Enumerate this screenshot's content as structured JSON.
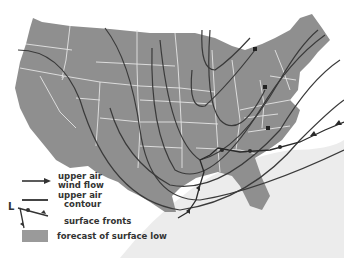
{
  "map": {
    "subject": "United States weather forecast map",
    "colors": {
      "land": "#8f8f8f",
      "state_borders": "#e4e4e4",
      "lines": "#3a3a3a",
      "surface_low": "#a5a5a5",
      "background": "#ffffff"
    }
  },
  "legend": {
    "items": [
      {
        "symbol": "arrow-line",
        "label_line1": "upper air",
        "label_line2": "wind flow"
      },
      {
        "symbol": "plain-line",
        "label_line1": "upper air",
        "label_line2": "contour"
      },
      {
        "symbol": "front-line",
        "label_line1": "surface fronts",
        "label_line2": "",
        "marker": "L"
      },
      {
        "symbol": "gray-box",
        "label_line1": "forecast of surface low",
        "label_line2": ""
      }
    ]
  }
}
